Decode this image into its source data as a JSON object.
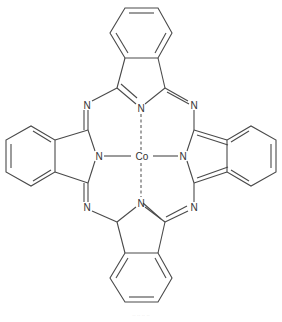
{
  "diagram": {
    "type": "chemical-structure",
    "name": "Cobalt phthalocyanine",
    "center_atom": "Co",
    "atoms": {
      "co": "Co",
      "n_top": "N",
      "n_left": "N",
      "n_right": "N",
      "n_bottom": "N",
      "n_meso_tl": "N",
      "n_meso_tr": "N",
      "n_meso_bl": "N",
      "n_meso_br": "N"
    },
    "colors": {
      "bond": "#4a4a4a",
      "label": "#333333",
      "background": "#ffffff"
    },
    "caption": "·· ·· ·· ··"
  }
}
